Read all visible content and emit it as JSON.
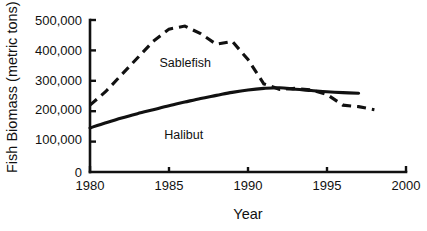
{
  "chart_data": {
    "type": "line",
    "title": "",
    "xlabel": "Year",
    "ylabel": "Fish Biomass (metric tons)",
    "xlim": [
      1980,
      2000
    ],
    "ylim": [
      0,
      500000
    ],
    "grid": false,
    "legend_position": "inline-annotation",
    "x_ticks": [
      1980,
      1985,
      1990,
      1995,
      2000
    ],
    "x_tick_labels": [
      "1980",
      "1985",
      "1990",
      "1995",
      "2000"
    ],
    "y_ticks": [
      0,
      100000,
      200000,
      300000,
      400000,
      500000
    ],
    "y_tick_labels": [
      "0",
      "100,000",
      "200,000",
      "300,000",
      "400,000",
      "500,000"
    ],
    "series": [
      {
        "name": "Sablefish",
        "style": "dashed",
        "color": "#111111",
        "x": [
          1980,
          1981,
          1982,
          1983,
          1984,
          1985,
          1986,
          1987,
          1988,
          1989,
          1990,
          1991,
          1992,
          1993,
          1994,
          1995,
          1996,
          1997,
          1998
        ],
        "values": [
          220000,
          265000,
          320000,
          375000,
          430000,
          470000,
          480000,
          455000,
          420000,
          430000,
          370000,
          290000,
          272000,
          275000,
          270000,
          255000,
          220000,
          215000,
          205000
        ]
      },
      {
        "name": "Halibut",
        "style": "solid",
        "color": "#111111",
        "x": [
          1980,
          1981,
          1982,
          1983,
          1984,
          1985,
          1986,
          1987,
          1988,
          1989,
          1990,
          1991,
          1992,
          1993,
          1994,
          1995,
          1996,
          1997
        ],
        "values": [
          145000,
          162000,
          178000,
          192000,
          205000,
          218000,
          230000,
          242000,
          252000,
          262000,
          270000,
          275000,
          277000,
          272000,
          268000,
          264000,
          261000,
          259000
        ]
      }
    ],
    "annotations": [
      {
        "text": "Sablefish",
        "x": 1984.4,
        "y": 345000
      },
      {
        "text": "Halibut",
        "x": 1984.7,
        "y": 110000
      }
    ]
  }
}
